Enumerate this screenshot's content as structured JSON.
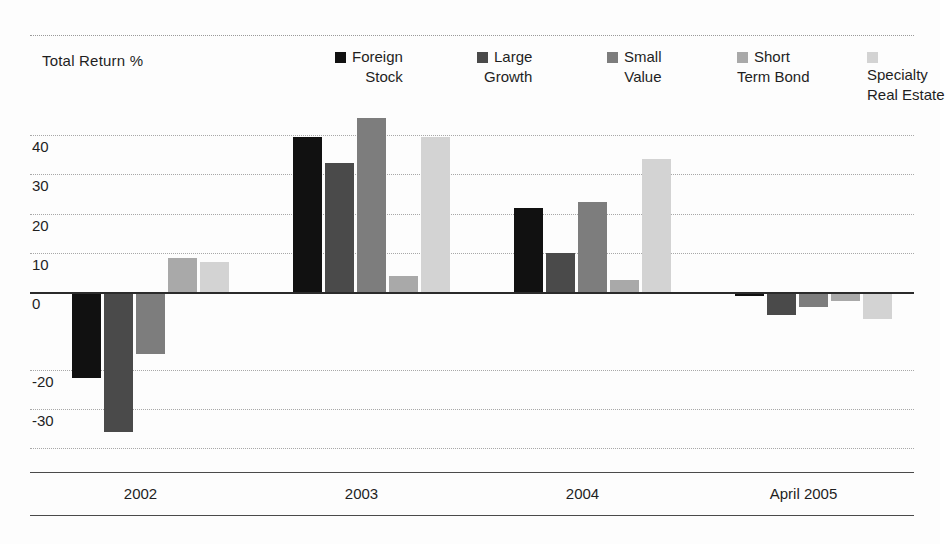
{
  "chart_data": {
    "type": "bar",
    "title": "",
    "ylabel": "Total Return %",
    "xlabel": "",
    "grid": true,
    "legend_position": "top-right",
    "ylim": [
      -40,
      47
    ],
    "yticks": [
      40,
      30,
      20,
      10,
      0,
      -20,
      -30
    ],
    "ytick_labels": [
      "40",
      "30",
      "20",
      "10",
      "0",
      "-20",
      "-30"
    ],
    "categories": [
      "2002",
      "2003",
      "2004",
      "April 2005"
    ],
    "series": [
      {
        "name": "Foreign Stock",
        "legend_line1": "Foreign",
        "legend_line2": "Stock",
        "color": "#111111",
        "values": [
          -22,
          39.5,
          21.5,
          -1
        ]
      },
      {
        "name": "Large Growth",
        "legend_line1": "Large",
        "legend_line2": "Growth",
        "color": "#4a4a4a",
        "values": [
          -36,
          33,
          10,
          -6
        ]
      },
      {
        "name": "Small Value",
        "legend_line1": "Small",
        "legend_line2": "Value",
        "color": "#7d7d7d",
        "values": [
          -16,
          44.5,
          23,
          -4
        ]
      },
      {
        "name": "Short Term Bond",
        "legend_line1": "Short",
        "legend_line2": "Term Bond",
        "color": "#a9a9a9",
        "values": [
          8.5,
          4,
          3,
          -2.5
        ]
      },
      {
        "name": "Specialty Real Estate",
        "legend_line1": "Specialty",
        "legend_line2": "Real Estate",
        "color": "#d3d3d3",
        "values": [
          7.5,
          39.5,
          34,
          -7
        ]
      }
    ]
  },
  "axis": {
    "title": "Total Return %"
  },
  "xaxis": {
    "labels": [
      "2002",
      "2003",
      "2004",
      "April 2005"
    ]
  }
}
